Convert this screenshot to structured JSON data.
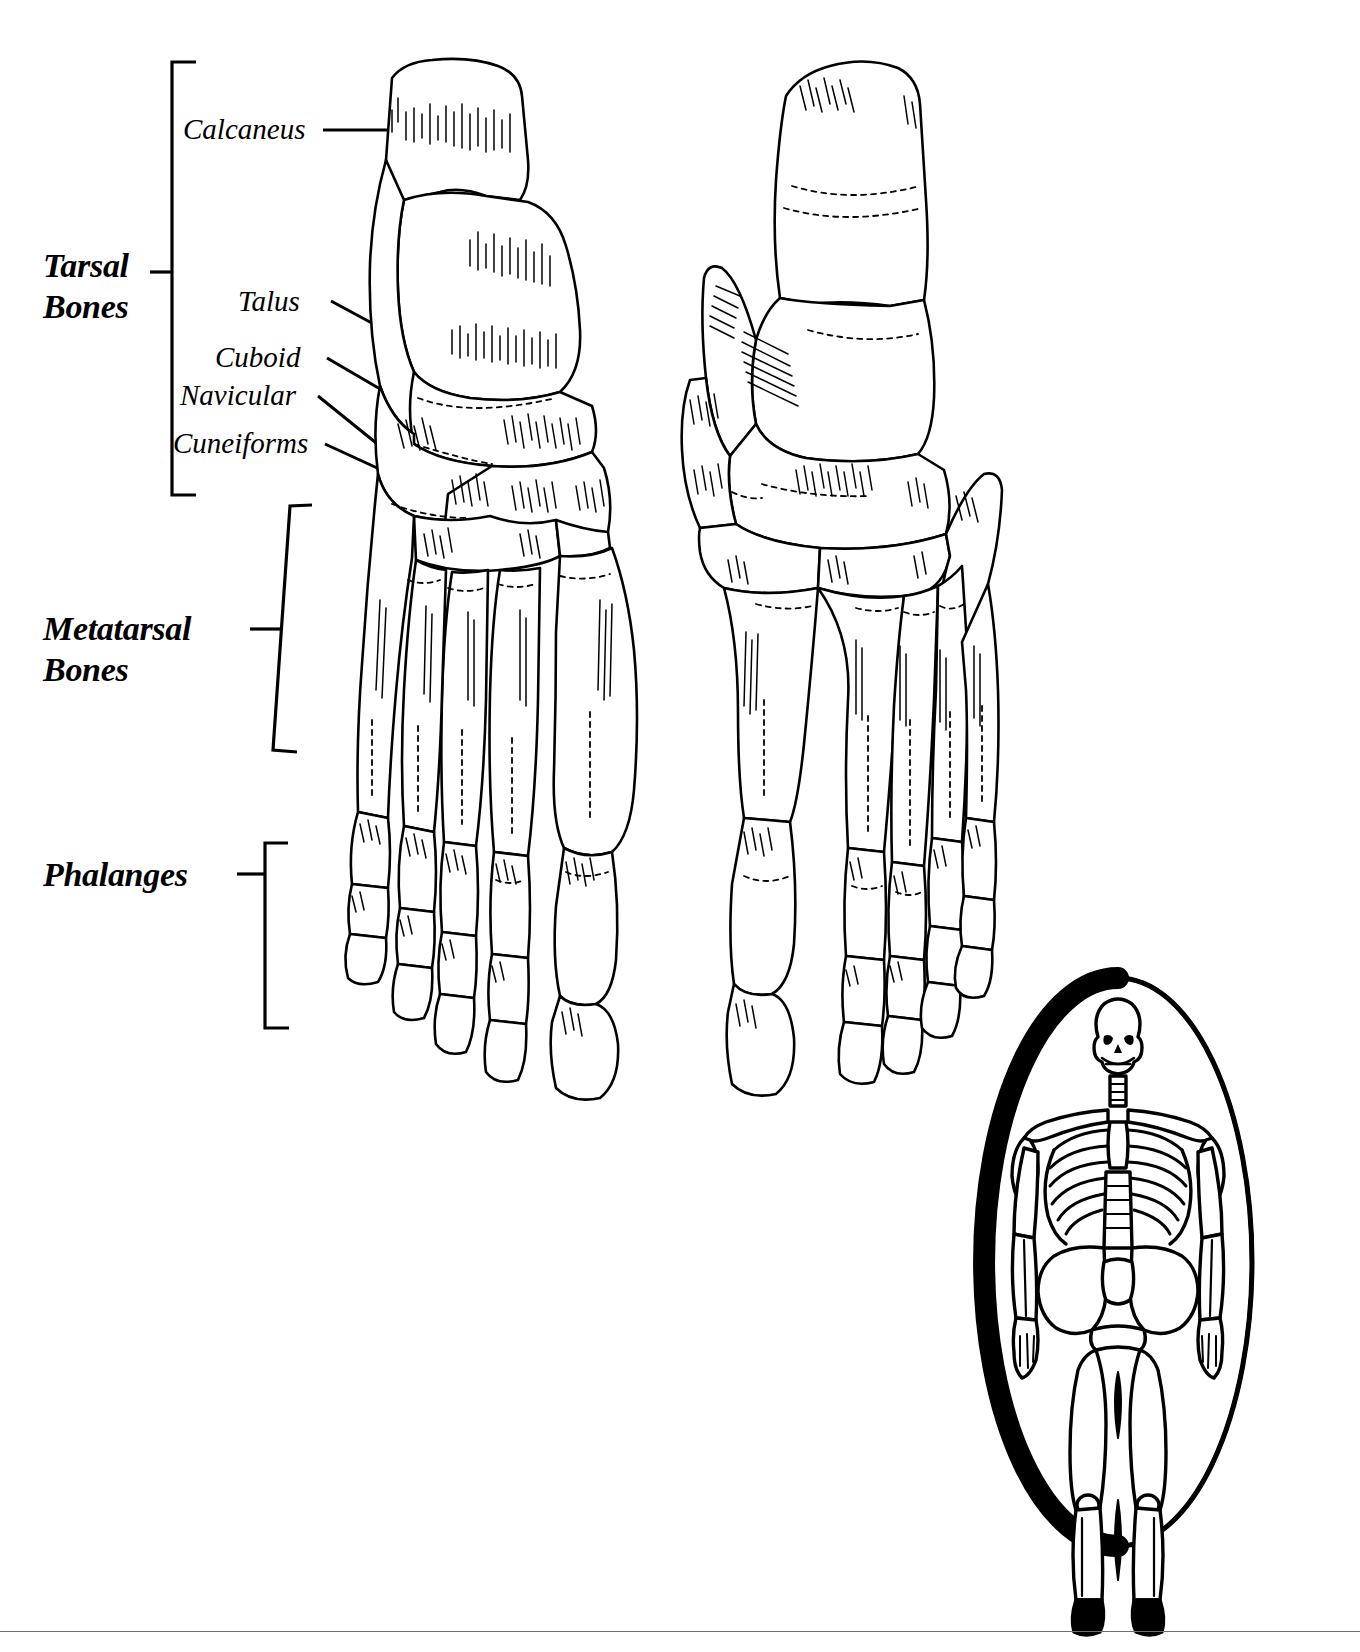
{
  "figure": {
    "line_color": "#000000",
    "background_color": "#ffffff",
    "rule_color": "#6f6f6f"
  },
  "category_labels": [
    {
      "id": "tarsal",
      "line1": "Tarsal",
      "line2": "Bones"
    },
    {
      "id": "metatarsal",
      "line1": "Metatarsal",
      "line2": "Bones"
    },
    {
      "id": "phalanges",
      "line1": "Phalanges",
      "line2": ""
    }
  ],
  "bone_labels": [
    {
      "id": "calcaneus",
      "text": "Calcaneus"
    },
    {
      "id": "talus",
      "text": "Talus"
    },
    {
      "id": "cuboid",
      "text": "Cuboid"
    },
    {
      "id": "navicular",
      "text": "Navicular"
    },
    {
      "id": "cuneiforms",
      "text": "Cuneiforms"
    }
  ],
  "inset": {
    "name": "full-skeleton-locator",
    "shape": "oval",
    "contents": "human skeleton, anterior view"
  }
}
